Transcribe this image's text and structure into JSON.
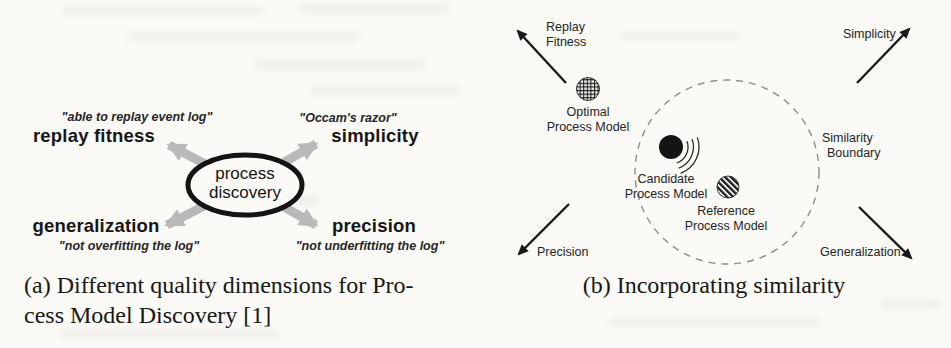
{
  "colors": {
    "background": "#fbfaf6",
    "ink": "#1a1a1a",
    "gray_arrow": "#b9b9b9",
    "dashed_boundary": "#8d8d8d"
  },
  "panel_a": {
    "caption_line1": "(a) Different quality dimensions for Pro-",
    "caption_line2": "cess Model Discovery [1]",
    "center_label": {
      "line1": "process",
      "line2": "discovery"
    },
    "top_left": {
      "quote": "\"able to replay event log\"",
      "label": "replay fitness"
    },
    "top_right": {
      "quote": "\"Occam's razor\"",
      "label": "simplicity"
    },
    "bottom_left": {
      "label": "generalization",
      "quote": "\"not overfitting the log\""
    },
    "bottom_right": {
      "label": "precision",
      "quote": "\"not underfitting the log\""
    }
  },
  "panel_b": {
    "caption": "(b) Incorporating similarity",
    "axis_labels": {
      "replay_fitness": {
        "line1": "Replay",
        "line2": "Fitness"
      },
      "simplicity": "Simplicity",
      "precision": "Precision",
      "generalization": "Generalization"
    },
    "similarity_boundary": {
      "line1": "Similarity",
      "line2": "Boundary"
    },
    "models": {
      "optimal": {
        "line1": "Optimal",
        "line2": "Process Model",
        "fill_style": "crosshatch"
      },
      "candidate": {
        "line1": "Candidate",
        "line2": "Process Model",
        "fill_style": "solid-black"
      },
      "reference": {
        "line1": "Reference",
        "line2": "Process Model",
        "fill_style": "diagonal-stripes"
      }
    }
  }
}
